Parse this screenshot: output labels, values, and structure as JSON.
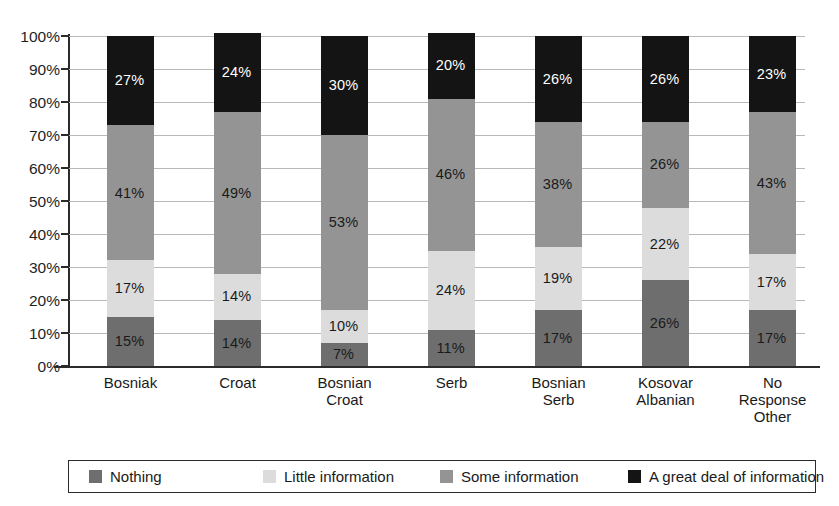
{
  "chart_data": {
    "type": "bar",
    "subtype": "stacked-bar-100",
    "title": "",
    "xlabel": "",
    "ylabel": "",
    "ylim": [
      0,
      100
    ],
    "grid": true,
    "legend_position": "bottom",
    "categories": [
      "Bosniak",
      "Croat",
      "Bosnian Croat",
      "Serb",
      "Bosnian Serb",
      "Kosovar Albanian",
      "No Response Other"
    ],
    "category_label_lines": [
      [
        "Bosniak"
      ],
      [
        "Croat"
      ],
      [
        "Bosnian",
        "Croat"
      ],
      [
        "Serb"
      ],
      [
        "Bosnian",
        "Serb"
      ],
      [
        "Kosovar",
        "Albanian"
      ],
      [
        "No",
        "Response",
        "Other"
      ]
    ],
    "ytick_labels": [
      "100%",
      "90%",
      "80%",
      "70%",
      "60%",
      "50%",
      "40%",
      "30%",
      "20%",
      "10%",
      "0%"
    ],
    "ytick_values": [
      100,
      90,
      80,
      70,
      60,
      50,
      40,
      30,
      20,
      10,
      0
    ],
    "series": [
      {
        "name": "Nothing",
        "color": "#6e6e6e",
        "label_color": "#1a1a1a",
        "values": [
          15,
          14,
          7,
          11,
          17,
          26,
          17
        ],
        "value_labels": [
          "15%",
          "14%",
          "7%",
          "11%",
          "17%",
          "26%",
          "17%"
        ]
      },
      {
        "name": "Little information",
        "color": "#dcdcdc",
        "label_color": "#1a1a1a",
        "values": [
          17,
          14,
          10,
          24,
          19,
          22,
          17
        ],
        "value_labels": [
          "17%",
          "14%",
          "10%",
          "24%",
          "19%",
          "22%",
          "17%"
        ]
      },
      {
        "name": "Some information",
        "color": "#949494",
        "label_color": "#1a1a1a",
        "values": [
          41,
          49,
          53,
          46,
          38,
          26,
          43
        ],
        "value_labels": [
          "41%",
          "49%",
          "53%",
          "46%",
          "38%",
          "26%",
          "43%"
        ]
      },
      {
        "name": "A great deal of information",
        "color": "#141414",
        "label_color": "#ffffff",
        "values": [
          27,
          24,
          30,
          20,
          26,
          26,
          23
        ],
        "value_labels": [
          "27%",
          "24%",
          "30%",
          "20%",
          "26%",
          "26%",
          "23%"
        ]
      }
    ]
  },
  "legend": {
    "items": [
      {
        "label": "Nothing",
        "color": "#6e6e6e"
      },
      {
        "label": "Little information",
        "color": "#dcdcdc"
      },
      {
        "label": "Some information",
        "color": "#949494"
      },
      {
        "label": "A great deal of information",
        "color": "#141414"
      }
    ]
  }
}
